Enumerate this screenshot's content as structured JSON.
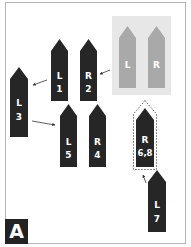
{
  "figure": {
    "panel_label": "A",
    "colors": {
      "dark_arrow": "#262626",
      "ghost_arrow": "#a9a9a9",
      "ghost_background": "#e7e7e7",
      "label_text": "#ffffff"
    },
    "ghost_pair": {
      "left": {
        "side": "L"
      },
      "right": {
        "side": "R"
      }
    },
    "arrows": [
      {
        "id": "L1",
        "side": "L",
        "order": "1"
      },
      {
        "id": "R2",
        "side": "R",
        "order": "2"
      },
      {
        "id": "L3",
        "side": "L",
        "order": "3"
      },
      {
        "id": "R4",
        "side": "R",
        "order": "4"
      },
      {
        "id": "L5",
        "side": "L",
        "order": "5"
      },
      {
        "id": "R68",
        "side": "R",
        "order": "6,8"
      },
      {
        "id": "L7",
        "side": "L",
        "order": "7"
      }
    ]
  }
}
